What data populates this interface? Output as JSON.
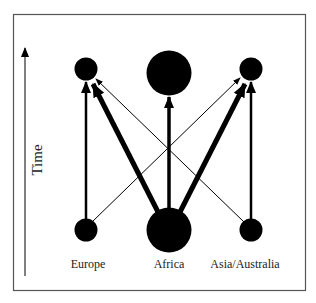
{
  "diagram": {
    "type": "migration-flow",
    "axis": {
      "label": "Time",
      "direction": "up"
    },
    "regions": [
      {
        "name": "Europe",
        "label": "Europe"
      },
      {
        "name": "Africa",
        "label": "Africa"
      },
      {
        "name": "Asia/Australia",
        "label": "Asia/Australia"
      }
    ],
    "nodes": {
      "top": [
        {
          "region": "Europe",
          "size": "small"
        },
        {
          "region": "Africa",
          "size": "large"
        },
        {
          "region": "Asia/Australia",
          "size": "small"
        }
      ],
      "bottom": [
        {
          "region": "Europe",
          "size": "small"
        },
        {
          "region": "Africa",
          "size": "large"
        },
        {
          "region": "Asia/Australia",
          "size": "small"
        }
      ]
    },
    "edges": [
      {
        "from": "Europe",
        "to": "Europe",
        "weight": "medium"
      },
      {
        "from": "Europe",
        "to": "Asia/Australia",
        "weight": "thin"
      },
      {
        "from": "Africa",
        "to": "Europe",
        "weight": "thick"
      },
      {
        "from": "Africa",
        "to": "Africa",
        "weight": "thick"
      },
      {
        "from": "Africa",
        "to": "Asia/Australia",
        "weight": "thick"
      },
      {
        "from": "Asia/Australia",
        "to": "Asia/Australia",
        "weight": "medium"
      },
      {
        "from": "Asia/Australia",
        "to": "Europe",
        "weight": "thin"
      }
    ],
    "colors": {
      "ink": "#000000",
      "border": "#555555",
      "background": "#ffffff"
    }
  }
}
